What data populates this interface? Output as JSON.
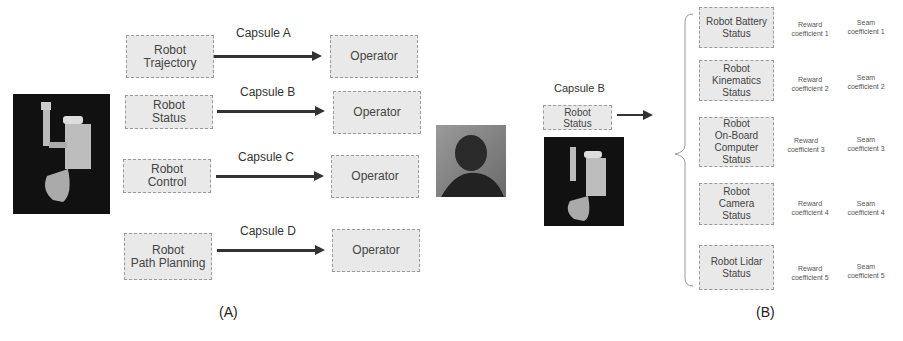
{
  "panel_a": {
    "label": "(A)",
    "rows": [
      {
        "source": "Robot\nTrajectory",
        "capsule": "Capsule A",
        "target": "Operator"
      },
      {
        "source": "Robot\nStatus",
        "capsule": "Capsule B",
        "target": "Operator"
      },
      {
        "source": "Robot\nControl",
        "capsule": "Capsule C",
        "target": "Operator"
      },
      {
        "source": "Robot\nPath Planning",
        "capsule": "Capsule D",
        "target": "Operator"
      }
    ],
    "images": {
      "robot": "robot-render-image",
      "operator": "operator-photo"
    }
  },
  "panel_b": {
    "label": "(B)",
    "capsule": "Capsule B",
    "source": "Robot\nStatus",
    "items": [
      {
        "name": "Robot Battery\nStatus",
        "reward": "Reward\ncoefficient 1",
        "seam": "Seam\ncoefficient 1"
      },
      {
        "name": "Robot\nKinematics\nStatus",
        "reward": "Reward\ncoefficient 2",
        "seam": "Seam\ncoefficient 2"
      },
      {
        "name": "Robot\nOn-Board\nComputer\nStatus",
        "reward": "Reward\ncoefficient 3",
        "seam": "Seam\ncoefficient 3"
      },
      {
        "name": "Robot\nCamera\nStatus",
        "reward": "Reward\ncoefficient 4",
        "seam": "Seam\ncoefficient 4"
      },
      {
        "name": "Robot Lidar\nStatus",
        "reward": "Reward\ncoefficient 5",
        "seam": "Seam\ncoefficient 5"
      }
    ]
  }
}
